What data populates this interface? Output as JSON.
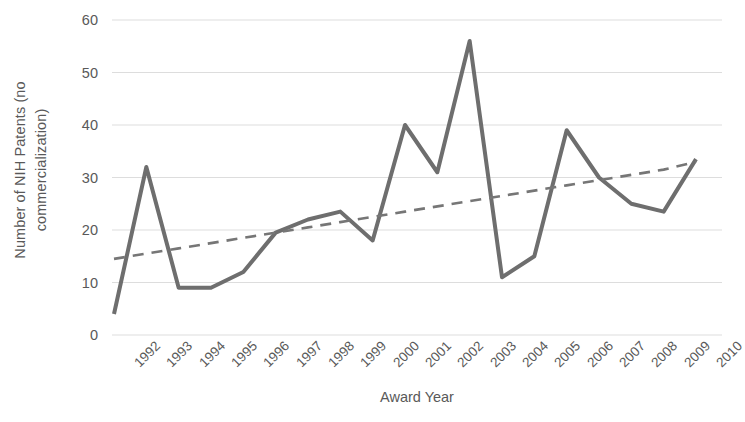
{
  "chart_data": {
    "type": "line",
    "title": "",
    "xlabel": "Award Year",
    "ylabel": "Number of NIH Patents (no commercialization)",
    "ylabel_line1": "Number of NIH Patents (no",
    "ylabel_line2": "commercialization)",
    "categories": [
      "1992",
      "1993",
      "1994",
      "1995",
      "1996",
      "1997",
      "1998",
      "1999",
      "2000",
      "2001",
      "2002",
      "2003",
      "2004",
      "2005",
      "2006",
      "2007",
      "2008",
      "2009",
      "2010"
    ],
    "series": [
      {
        "name": "Number of NIH Patents (no commercialization)",
        "style": "solid",
        "color": "#6E6E6E",
        "values": [
          4,
          32,
          9,
          9,
          12,
          19.5,
          22,
          23.5,
          18,
          40,
          31,
          56,
          11,
          15,
          39,
          30,
          25,
          23.5,
          33.5
        ]
      },
      {
        "name": "Linear trendline",
        "style": "dashed",
        "color": "#767676",
        "values": [
          14.5,
          15.5,
          16.5,
          17.5,
          18.5,
          19.5,
          20.5,
          21.5,
          22.5,
          23.5,
          24.5,
          25.5,
          26.5,
          27.5,
          28.5,
          29.5,
          30.5,
          31.5,
          33
        ]
      }
    ],
    "ylim": [
      0,
      60
    ],
    "yticks": [
      0,
      10,
      20,
      30,
      40,
      50,
      60
    ],
    "ytick_labels": [
      "0",
      "10",
      "20",
      "30",
      "40",
      "50",
      "60"
    ],
    "grid": "horizontal",
    "grid_color": "#DDDDDD",
    "legend": "none",
    "background": "#FFFFFF",
    "text_color": "#595959"
  }
}
